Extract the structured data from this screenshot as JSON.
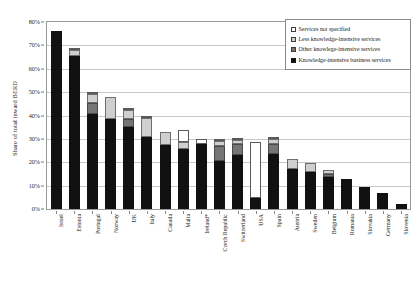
{
  "chart_data": {
    "type": "bar",
    "stacked": true,
    "title": "",
    "xlabel": "",
    "ylabel": "Share of total inward BERD",
    "ylim": [
      0,
      80
    ],
    "ytick_labels": [
      "0%",
      "10%",
      "20%",
      "30%",
      "40%",
      "50%",
      "60%",
      "70%",
      "80%"
    ],
    "ytick_values": [
      0,
      10,
      20,
      30,
      40,
      50,
      60,
      70,
      80
    ],
    "grid": true,
    "legend_position": "top-right",
    "categories": [
      "Israel",
      "Estonia",
      "Portugal",
      "Norway",
      "UK",
      "Italy",
      "Canada",
      "Malta",
      "Ireland*",
      "Czech Republic",
      "Switzerland",
      "USA",
      "Spain",
      "Austria",
      "Sweden",
      "Belgium",
      "Romania",
      "Slovakia",
      "Germany",
      "Slovenia"
    ],
    "series": [
      {
        "name": "Knowledge-intensive business services",
        "color": "#111111",
        "values": [
          76.0,
          65.5,
          40.5,
          38.5,
          35.0,
          31.0,
          27.5,
          25.5,
          28.0,
          20.5,
          23.0,
          4.5,
          23.5,
          17.0,
          16.0,
          13.5,
          13.0,
          9.5,
          7.0,
          2.0
        ]
      },
      {
        "name": "Other knowledge-intensive services",
        "color": "#757575",
        "values": [
          0.0,
          0.0,
          5.0,
          0.0,
          3.5,
          0.0,
          0.0,
          0.0,
          0.0,
          6.5,
          5.0,
          0.0,
          4.5,
          0.0,
          0.0,
          1.5,
          0.0,
          0.0,
          0.0,
          0.0
        ]
      },
      {
        "name": "Less knowledge-intensive services",
        "color": "#cfcfcf",
        "values": [
          0.0,
          2.5,
          3.5,
          9.5,
          4.0,
          8.0,
          5.5,
          3.0,
          0.0,
          2.0,
          1.5,
          0.0,
          2.0,
          4.5,
          3.5,
          1.5,
          0.0,
          0.0,
          0.0,
          0.0
        ]
      },
      {
        "name": "Services not specified",
        "color": "#ffffff",
        "values": [
          0.0,
          0.8,
          0.8,
          0.0,
          0.8,
          0.8,
          0.0,
          5.5,
          2.0,
          0.8,
          0.8,
          24.0,
          0.8,
          0.0,
          0.0,
          0.0,
          0.0,
          0.0,
          0.0,
          0.0
        ]
      }
    ],
    "totals": [
      76.0,
      68.8,
      49.8,
      48.0,
      43.3,
      39.8,
      33.0,
      34.0,
      30.0,
      29.8,
      30.3,
      28.5,
      30.8,
      21.5,
      19.5,
      16.5,
      13.0,
      9.5,
      7.0,
      2.0
    ]
  },
  "legend": {
    "items": [
      {
        "label": "Services not specified",
        "swatch": "sw-ns"
      },
      {
        "label": "Less knowledge-intensive services",
        "swatch": "sw-less"
      },
      {
        "label": "Other knowlege-intensive services",
        "swatch": "sw-other"
      },
      {
        "label": "Knowledge-intensive business services",
        "swatch": "sw-kibs"
      }
    ]
  }
}
